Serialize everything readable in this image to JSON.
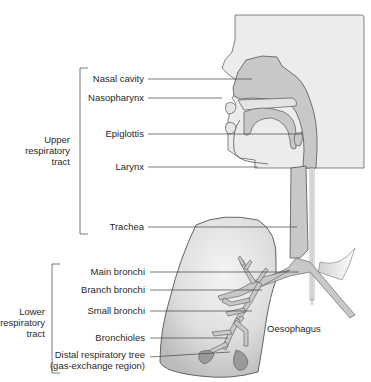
{
  "diagram": {
    "colors": {
      "head_box": "#ececec",
      "airway": "#c8c8c8",
      "lung_fill": "#dcdcdc",
      "outline": "#555555",
      "leader": "#444444",
      "text": "#2a2a2a"
    },
    "groups": [
      {
        "id": "upper",
        "label_lines": [
          "Upper",
          "respiratory",
          "tract"
        ]
      },
      {
        "id": "lower",
        "label_lines": [
          "Lower",
          "respiratory",
          "tract"
        ]
      }
    ],
    "labels": [
      {
        "id": "nasal-cavity",
        "text": "Nasal cavity",
        "group": "upper"
      },
      {
        "id": "nasopharynx",
        "text": "Nasopharynx",
        "group": "upper"
      },
      {
        "id": "epiglottis",
        "text": "Epiglottis",
        "group": "upper"
      },
      {
        "id": "larynx",
        "text": "Larynx",
        "group": "upper"
      },
      {
        "id": "trachea",
        "text": "Trachea",
        "group": "upper"
      },
      {
        "id": "main-bronchi",
        "text": "Main bronchi",
        "group": "lower"
      },
      {
        "id": "branch-bronchi",
        "text": "Branch bronchi",
        "group": "lower"
      },
      {
        "id": "small-bronchi",
        "text": "Small bronchi",
        "group": "lower"
      },
      {
        "id": "bronchioles",
        "text": "Bronchioles",
        "group": "lower"
      },
      {
        "id": "distal-tree",
        "text": "Distal respiratory tree",
        "text2": "(gas-exchange region)",
        "group": "lower"
      },
      {
        "id": "oesophagus",
        "text": "Oesophagus",
        "group": "other"
      }
    ]
  }
}
